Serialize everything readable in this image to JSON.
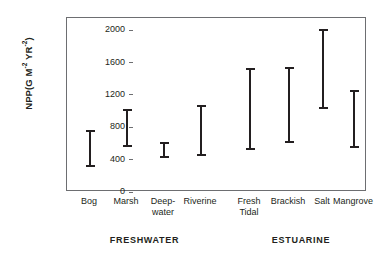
{
  "chart_data": {
    "type": "errorbar",
    "title": "",
    "xlabel": "",
    "ylabel": "NPP(G M-2 YR-2)",
    "ylabel_parts": {
      "prefix": "NPP(G M",
      "exp1": "-2",
      "middle": " YR",
      "exp2": "-2",
      "suffix": ")"
    },
    "ylim": [
      0,
      2150
    ],
    "yticks": [
      0,
      400,
      800,
      1200,
      1600,
      2000
    ],
    "ytick_labels": [
      "0",
      "400",
      "800",
      "1200",
      "1600",
      "2000"
    ],
    "grid": false,
    "legend": "none",
    "categories": [
      "Bog",
      "Marsh",
      "Deep-water",
      "Riverine",
      "Fresh Tidal",
      "Brackish",
      "Salt",
      "Mangrove"
    ],
    "category_labels": [
      {
        "line1": "Bog",
        "line2": ""
      },
      {
        "line1": "Marsh",
        "line2": ""
      },
      {
        "line1": "Deep-",
        "line2": "water"
      },
      {
        "line1": "Riverine",
        "line2": ""
      },
      {
        "line1": "Fresh",
        "line2": "Tidal"
      },
      {
        "line1": "Brackish",
        "line2": ""
      },
      {
        "line1": "Salt",
        "line2": ""
      },
      {
        "line1": "Mangrove",
        "line2": ""
      }
    ],
    "ranges": [
      {
        "category": "Bog",
        "low": 310,
        "high": 760
      },
      {
        "category": "Marsh",
        "low": 555,
        "high": 1020
      },
      {
        "category": "Deep-water",
        "low": 415,
        "high": 620
      },
      {
        "category": "Riverine",
        "low": 440,
        "high": 1070
      },
      {
        "category": "Fresh Tidal",
        "low": 515,
        "high": 1535
      },
      {
        "category": "Brackish",
        "low": 605,
        "high": 1550
      },
      {
        "category": "Salt",
        "low": 1030,
        "high": 2020
      },
      {
        "category": "Mangrove",
        "low": 545,
        "high": 1265
      }
    ],
    "groups": [
      {
        "label": "FRESHWATER",
        "categories": [
          "Bog",
          "Marsh",
          "Deep-water",
          "Riverine"
        ]
      },
      {
        "label": "ESTUARINE",
        "categories": [
          "Fresh Tidal",
          "Brackish",
          "Salt",
          "Mangrove"
        ]
      }
    ],
    "colors": {
      "bar": "#231f20",
      "axis": "#6d6e71",
      "background": "#ffffff",
      "text": "#231f20"
    }
  }
}
